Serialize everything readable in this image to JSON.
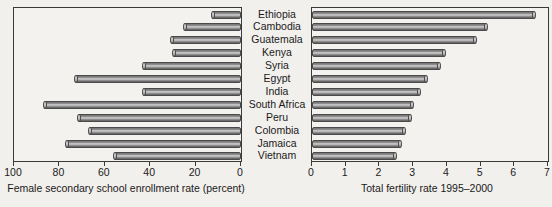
{
  "chart_data": {
    "type": "bar",
    "title": "",
    "orientation": "horizontal",
    "layout": "back-to-back paired horizontal bar chart, shared category axis in center",
    "grid": false,
    "legend": null,
    "categories": [
      "Ethiopia",
      "Cambodia",
      "Guatemala",
      "Kenya",
      "Syria",
      "Egypt",
      "India",
      "South Africa",
      "Peru",
      "Colombia",
      "Jamaica",
      "Vietnam"
    ],
    "panels": [
      {
        "id": "left",
        "xlabel": "Female secondary school enrollment rate (percent)",
        "direction": "right-to-left",
        "xlim": [
          100,
          0
        ],
        "ticks": [
          100,
          80,
          60,
          40,
          20,
          0
        ],
        "tick_labels": [
          "100",
          "80",
          "60",
          "40",
          "20",
          "0"
        ],
        "values": [
          13,
          25,
          31,
          30,
          43,
          73,
          43,
          87,
          72,
          67,
          77,
          56
        ]
      },
      {
        "id": "right",
        "xlabel": "Total fertility rate 1995–2000",
        "direction": "left-to-right",
        "xlim": [
          0,
          7
        ],
        "ticks": [
          0,
          1,
          2,
          3,
          4,
          5,
          6,
          7
        ],
        "tick_labels": [
          "0",
          "1",
          "2",
          "3",
          "4",
          "5",
          "6",
          "7"
        ],
        "values": [
          6.6,
          5.2,
          4.85,
          3.95,
          3.8,
          3.4,
          3.2,
          3.0,
          2.95,
          2.75,
          2.65,
          2.5
        ]
      }
    ]
  },
  "colors": {
    "background": "#f2f0ed",
    "plot_background": "#f4f2ef",
    "bar_dark": "#6a6a6a",
    "bar_light": "#cfcfcf",
    "axis": "#3a3a3a",
    "text": "#1a1a1a"
  }
}
